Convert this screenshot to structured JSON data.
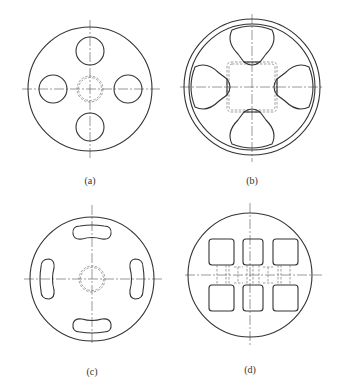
{
  "figure": {
    "panels": [
      {
        "id": "a",
        "label": "(a)",
        "description": "Circular plate with four round holes at 90° spacing and hidden central circular bore"
      },
      {
        "id": "b",
        "label": "(b)",
        "description": "Circular plate with double outer rim, four rounded-triangular cutouts and hidden central square"
      },
      {
        "id": "c",
        "label": "(c)",
        "description": "Circular plate with four curved slots (kidney-shaped) and hidden central circular bore"
      },
      {
        "id": "d",
        "label": "(d)",
        "description": "Circular plate with six rounded-square pockets in two rows and hidden connecting channels"
      }
    ]
  },
  "colors": {
    "line": "#333333",
    "hidden_line": "#777777",
    "background": "#ffffff"
  }
}
